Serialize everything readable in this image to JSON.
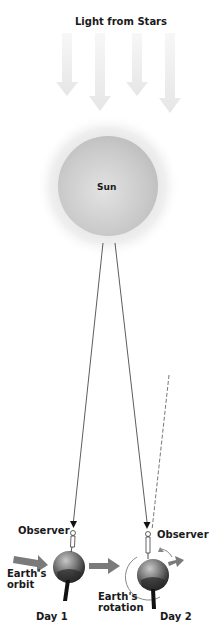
{
  "title": "Light from Stars",
  "sun": {
    "label": "Sun",
    "color": "#c9c9c9",
    "glow": "#e8e8e8"
  },
  "labels": {
    "observer_day1": "Observer",
    "observer_day2": "Observer",
    "earths_orbit_line1": "Earth's",
    "earths_orbit_line2": "orbit",
    "earths_rotation_line1": "Earth's",
    "earths_rotation_line2": "rotation",
    "day1": "Day 1",
    "day2": "Day 2"
  },
  "colors": {
    "text": "#1a1a1a",
    "light_arrow": "#ececec",
    "orbit_arrow": "#7a7a7a",
    "ray_line": "#333333",
    "earth_dark": "#2e2e2e",
    "earth_light": "#9a9a9a"
  }
}
